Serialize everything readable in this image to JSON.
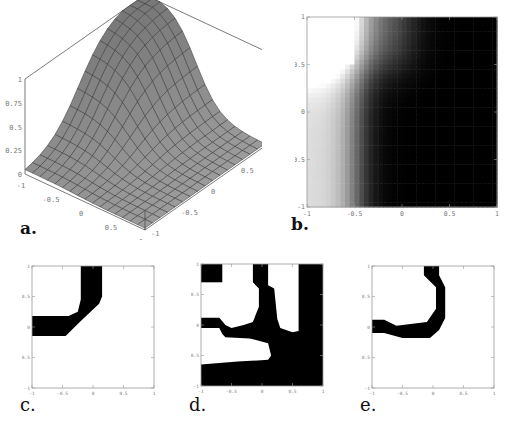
{
  "labels": {
    "a": "a.",
    "b": "b.",
    "c": "c.",
    "d": "d.",
    "e": "e."
  },
  "colors": {
    "surface": "#9a9a9a",
    "surface_dark": "#7d7d7d",
    "grid": "#333333",
    "frame": "#999999",
    "ink": "#000000"
  },
  "chart_data": [
    {
      "id": "a",
      "type": "surface3d",
      "title": "",
      "x_ticks": [
        "-1",
        "-0.5",
        "0",
        "0.5",
        "1"
      ],
      "y_ticks": [
        "-1",
        "-0.5",
        "0",
        "0.5",
        "1"
      ],
      "z_ticks": [
        "0",
        "0.25",
        "0.5",
        "0.75",
        "1"
      ],
      "xlim": [
        -1,
        1
      ],
      "ylim": [
        -1,
        1
      ],
      "zlim": [
        0,
        1
      ],
      "description": "Smooth sigmoid-like surface, high (~1) in one corner region, falling to ~0 elsewhere"
    },
    {
      "id": "b",
      "type": "heatmap",
      "title": "",
      "x_ticks": [
        "-1",
        "-0.5",
        "0",
        "0.5",
        "1"
      ],
      "y_ticks": [
        "-1",
        "-0.5",
        "0",
        "0.5",
        "1"
      ],
      "xlim": [
        -1,
        1
      ],
      "ylim": [
        -1,
        1
      ],
      "description": "Grayscale density plot: white in upper-left block (x<-0.5, y>0.5), fading to black toward lower-right"
    },
    {
      "id": "c",
      "type": "region",
      "x_ticks": [
        "-1",
        "-0.5",
        "0",
        "0.5",
        "1"
      ],
      "y_ticks": [
        "-1",
        "-0.5",
        "0",
        "0.5",
        "1"
      ],
      "xlim": [
        -1,
        1
      ],
      "ylim": [
        -1,
        1
      ],
      "polygons": [
        [
          [
            -0.2,
            1
          ],
          [
            0.15,
            1
          ],
          [
            0.15,
            0.5
          ],
          [
            0.1,
            0.38
          ],
          [
            -0.2,
            0.1
          ],
          [
            -0.45,
            -0.15
          ],
          [
            -1,
            -0.15
          ],
          [
            -1,
            0.18
          ],
          [
            -0.4,
            0.18
          ],
          [
            -0.25,
            0.25
          ],
          [
            -0.2,
            0.45
          ]
        ]
      ]
    },
    {
      "id": "d",
      "type": "region",
      "x_ticks": [
        "-1",
        "-0.5",
        "0",
        "0.5",
        "1"
      ],
      "y_ticks": [
        "-1",
        "-0.5",
        "0",
        "0.5",
        "1"
      ],
      "xlim": [
        -1,
        1
      ],
      "ylim": [
        -1,
        1
      ],
      "polygons": [
        [
          [
            -1,
            1
          ],
          [
            -0.65,
            1
          ],
          [
            -0.65,
            0.7
          ],
          [
            -1,
            0.7
          ]
        ],
        [
          [
            -0.15,
            1
          ],
          [
            0.1,
            1
          ],
          [
            0.1,
            0.65
          ],
          [
            0.2,
            0.6
          ],
          [
            0.25,
            0.1
          ],
          [
            0.3,
            -0.05
          ],
          [
            0.5,
            -0.12
          ],
          [
            0.6,
            -0.1
          ],
          [
            0.6,
            1
          ],
          [
            1,
            1
          ],
          [
            1,
            -1
          ],
          [
            -1,
            -1
          ],
          [
            -1,
            -0.65
          ],
          [
            -0.4,
            -0.6
          ],
          [
            0.1,
            -0.57
          ],
          [
            0.15,
            -0.5
          ],
          [
            0.1,
            -0.3
          ],
          [
            -0.2,
            -0.22
          ],
          [
            -0.6,
            -0.2
          ],
          [
            -0.65,
            -0.15
          ],
          [
            -0.7,
            -0.05
          ],
          [
            -1,
            -0.05
          ],
          [
            -1,
            0.12
          ],
          [
            -0.7,
            0.12
          ],
          [
            -0.6,
            0
          ],
          [
            -0.5,
            -0.05
          ],
          [
            -0.3,
            0
          ],
          [
            -0.15,
            0.05
          ],
          [
            -0.05,
            0.3
          ],
          [
            -0.05,
            0.6
          ],
          [
            -0.15,
            0.7
          ]
        ]
      ]
    },
    {
      "id": "e",
      "type": "region",
      "x_ticks": [
        "-1",
        "-0.5",
        "0",
        "0.5",
        "1"
      ],
      "y_ticks": [
        "-1",
        "-0.5",
        "0",
        "0.5",
        "1"
      ],
      "xlim": [
        -1,
        1
      ],
      "ylim": [
        -1,
        1
      ],
      "polygons": [
        [
          [
            -0.15,
            1
          ],
          [
            0.1,
            1
          ],
          [
            0.1,
            0.85
          ],
          [
            0.2,
            0.65
          ],
          [
            0.2,
            0.15
          ],
          [
            0.1,
            -0.05
          ],
          [
            -0.05,
            -0.18
          ],
          [
            -0.5,
            -0.18
          ],
          [
            -0.8,
            -0.1
          ],
          [
            -1,
            -0.1
          ],
          [
            -1,
            0.12
          ],
          [
            -0.8,
            0.12
          ],
          [
            -0.6,
            0.02
          ],
          [
            -0.1,
            0.08
          ],
          [
            0.05,
            0.3
          ],
          [
            0.05,
            0.65
          ],
          [
            -0.15,
            0.85
          ]
        ]
      ]
    }
  ]
}
